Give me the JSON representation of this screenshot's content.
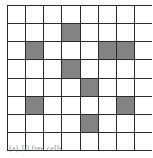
{
  "figure": {
    "kind": "shaded-grid",
    "caption": "(a) 10 free cells",
    "grid": {
      "rows": 8,
      "cols": 8,
      "cell_size_px": 17,
      "line_color": "#2b2b2b",
      "empty_color": "#ffffff",
      "shaded_color": "#5a5a5a",
      "shaded_fill_style": "crosshatch",
      "shaded_count": 9,
      "empty_count": 55,
      "shaded_cells": [
        {
          "row": 2,
          "col": 4
        },
        {
          "row": 3,
          "col": 2
        },
        {
          "row": 3,
          "col": 6
        },
        {
          "row": 3,
          "col": 7
        },
        {
          "row": 4,
          "col": 4
        },
        {
          "row": 5,
          "col": 5
        },
        {
          "row": 6,
          "col": 2
        },
        {
          "row": 6,
          "col": 7
        },
        {
          "row": 7,
          "col": 5
        }
      ],
      "matrix": [
        [
          0,
          0,
          0,
          0,
          0,
          0,
          0,
          0
        ],
        [
          0,
          0,
          0,
          1,
          0,
          0,
          0,
          0
        ],
        [
          0,
          1,
          0,
          0,
          0,
          1,
          1,
          0
        ],
        [
          0,
          0,
          0,
          1,
          0,
          0,
          0,
          0
        ],
        [
          0,
          0,
          0,
          0,
          1,
          0,
          0,
          0
        ],
        [
          0,
          1,
          0,
          0,
          0,
          0,
          1,
          0
        ],
        [
          0,
          0,
          0,
          0,
          1,
          0,
          0,
          0
        ],
        [
          0,
          0,
          0,
          0,
          0,
          0,
          0,
          0
        ]
      ],
      "row_labels": [
        "1",
        "2",
        "3",
        "4",
        "5",
        "6",
        "7",
        "8"
      ],
      "col_labels": [
        "1",
        "2",
        "3",
        "4",
        "5",
        "6",
        "7",
        "8"
      ]
    }
  }
}
